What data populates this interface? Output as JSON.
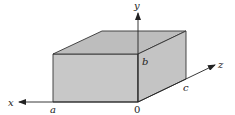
{
  "diagram": {
    "colors": {
      "face_fill": "#c8c8c8",
      "top_fill": "#bdbdbd",
      "side_fill": "#c4c4c4",
      "edge": "#333333",
      "axis": "#222222"
    },
    "axes": {
      "x": {
        "label": "x"
      },
      "y": {
        "label": "y"
      },
      "z": {
        "label": "z"
      }
    },
    "dimensions": {
      "a": "a",
      "b": "b",
      "c": "c"
    },
    "origin_label": "0"
  }
}
